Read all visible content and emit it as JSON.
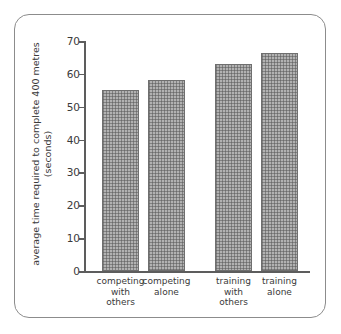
{
  "figure": {
    "frame_color": "#8c8c8c",
    "background": "#ffffff",
    "bar_fill": "#b2b2b2",
    "bar_edge": "#6f6f6f",
    "axis_color": "#5d5d5d"
  },
  "chart_data": {
    "type": "bar",
    "title": "",
    "xlabel": "",
    "ylabel": "average time required to complete 400 metres (seconds)",
    "categories": [
      "competing with others",
      "competing alone",
      "training with others",
      "training alone"
    ],
    "category_lines": [
      [
        "competing",
        "with",
        "others"
      ],
      [
        "competing",
        "alone"
      ],
      [
        "training",
        "with",
        "others"
      ],
      [
        "training",
        "alone"
      ]
    ],
    "values": [
      55,
      58,
      63,
      66.5
    ],
    "ylim": [
      0,
      70
    ],
    "ytick_labels": [
      "0",
      "10",
      "20",
      "30",
      "40",
      "50",
      "60",
      "70"
    ],
    "ytick_values": [
      0,
      10,
      20,
      30,
      40,
      50,
      60,
      70
    ],
    "grid": false,
    "legend": "none"
  }
}
